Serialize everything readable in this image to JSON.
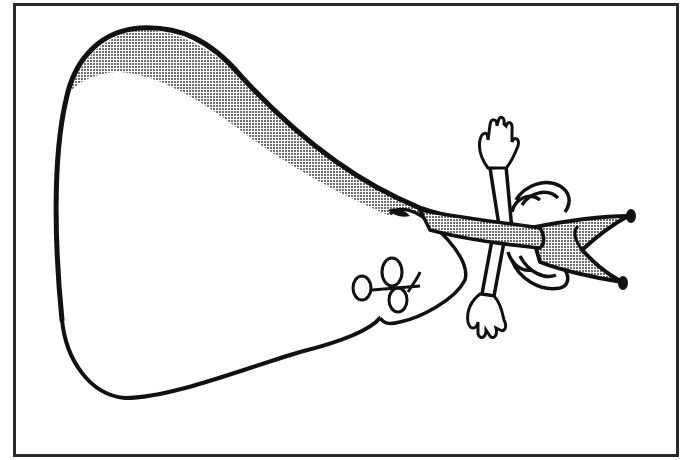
{
  "illustration": {
    "subject": "jester-figure-clipart",
    "style": "black-and-white line art with halftone shading",
    "colors": {
      "ink": "#111111",
      "shade": "#9a9a9a",
      "paper": "#ffffff",
      "frame": "#2a2a2a"
    },
    "parts": [
      "body-cape",
      "shaded-band",
      "jester-hat",
      "hat-bell-top",
      "hat-bell-bottom",
      "ruff-collar",
      "arm-raised",
      "hand-raised",
      "arm-lowered",
      "hand-lowered",
      "face",
      "eyes",
      "nose"
    ]
  }
}
